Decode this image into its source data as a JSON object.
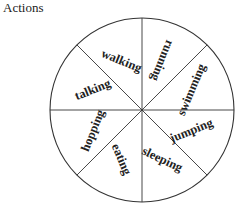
{
  "title": "Actions",
  "wheel": {
    "center": [
      142,
      110
    ],
    "radius": 92,
    "stroke_color": "#333333",
    "segments": [
      {
        "label": "running",
        "angle": -67.5,
        "upside_down": true
      },
      {
        "label": "swimming",
        "angle": -22.5
      },
      {
        "label": "jumping",
        "angle": 22.5
      },
      {
        "label": "sleeping",
        "angle": 67.5
      },
      {
        "label": "eating",
        "angle": 112.5
      },
      {
        "label": "hopping",
        "angle": 157.5
      },
      {
        "label": "talking",
        "angle": 202.5
      },
      {
        "label": "walking",
        "angle": 247.5
      }
    ]
  }
}
